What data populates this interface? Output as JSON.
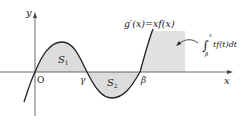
{
  "diagram": {
    "axes": {
      "x_label": "x",
      "y_label": "y",
      "origin_label": "O"
    },
    "points": {
      "gamma_label": "γ",
      "beta_label": "β"
    },
    "regions": {
      "s1_label": "S",
      "s1_sub": "1",
      "s2_label": "S",
      "s2_sub": "2"
    },
    "curve_label": "g′(x)=xf(x)",
    "integral": {
      "lower": "β",
      "upper": "x",
      "integrand": "tf(t)dt",
      "symbol": "∫"
    },
    "colors": {
      "shade": "#dcdcdc",
      "curve": "#222222",
      "axis": "#444444"
    }
  }
}
